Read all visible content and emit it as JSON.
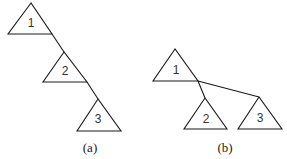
{
  "diagram": {
    "panels": [
      {
        "caption": "(a)",
        "caption_pos": [
          90,
          150
        ],
        "nodes": [
          {
            "label": "1",
            "apex": [
              31,
              3
            ],
            "left": [
              8,
              34
            ],
            "right": [
              52,
              34
            ]
          },
          {
            "label": "2",
            "apex": [
              64,
              52
            ],
            "left": [
              43,
              82
            ],
            "right": [
              87,
              82
            ]
          },
          {
            "label": "3",
            "apex": [
              98,
              99
            ],
            "left": [
              77,
              131
            ],
            "right": [
              121,
              131
            ]
          }
        ],
        "edges": [
          {
            "from": [
              52,
              34
            ],
            "to": [
              64,
              52
            ]
          },
          {
            "from": [
              87,
              82
            ],
            "to": [
              98,
              99
            ]
          }
        ]
      },
      {
        "caption": "(b)",
        "caption_pos": [
          225,
          150
        ],
        "nodes": [
          {
            "label": "1",
            "apex": [
              175,
              49
            ],
            "left": [
              153,
              81
            ],
            "right": [
              198,
              81
            ]
          },
          {
            "label": "2",
            "apex": [
              205,
              98
            ],
            "left": [
              184,
              129
            ],
            "right": [
              227,
              129
            ]
          },
          {
            "label": "3",
            "apex": [
              259,
              97
            ],
            "left": [
              238,
              129
            ],
            "right": [
              282,
              129
            ]
          }
        ],
        "edges": [
          {
            "from": [
              198,
              81
            ],
            "to": [
              205,
              98
            ]
          },
          {
            "from": [
              198,
              81
            ],
            "to": [
              259,
              97
            ]
          }
        ]
      }
    ]
  }
}
